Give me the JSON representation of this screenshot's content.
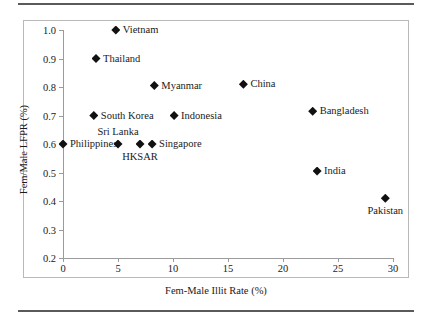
{
  "chart_data": {
    "type": "scatter",
    "title": "",
    "xlabel": "Fem-Male Illit Rate (%)",
    "ylabel": "Fem/Male LFPR (%)",
    "xlim": [
      0,
      30
    ],
    "ylim": [
      0.2,
      1.0
    ],
    "xticks": [
      "0",
      "5",
      "10",
      "15",
      "20",
      "25",
      "30"
    ],
    "xtick_values": [
      0,
      5,
      10,
      15,
      20,
      25,
      30
    ],
    "yticks": [
      "0.2",
      "0.3",
      "0.4",
      "0.5",
      "0.6",
      "0.7",
      "0.8",
      "0.9",
      "1.0"
    ],
    "ytick_values": [
      0.2,
      0.3,
      0.4,
      0.5,
      0.6,
      0.7,
      0.8,
      0.9,
      1.0
    ],
    "grid": false,
    "legend": "none",
    "marker": "diamond",
    "marker_color": "#111111",
    "points": [
      {
        "label": "Vietnam",
        "x": 4.8,
        "y": 1.0,
        "label_pos": "right"
      },
      {
        "label": "Thailand",
        "x": 3.0,
        "y": 0.9,
        "label_pos": "right"
      },
      {
        "label": "Myanmar",
        "x": 8.3,
        "y": 0.805,
        "label_pos": "right"
      },
      {
        "label": "China",
        "x": 16.4,
        "y": 0.81,
        "label_pos": "right"
      },
      {
        "label": "South Korea",
        "x": 2.8,
        "y": 0.7,
        "label_pos": "right"
      },
      {
        "label": "Indonesia",
        "x": 10.1,
        "y": 0.7,
        "label_pos": "right"
      },
      {
        "label": "Bangladesh",
        "x": 22.7,
        "y": 0.715,
        "label_pos": "right"
      },
      {
        "label": "Philippines",
        "x": 0.0,
        "y": 0.6,
        "label_pos": "right"
      },
      {
        "label": "Sri Lanka",
        "x": 5.0,
        "y": 0.6,
        "label_pos": "above"
      },
      {
        "label": "HKSAR",
        "x": 7.0,
        "y": 0.6,
        "label_pos": "below"
      },
      {
        "label": "Singapore",
        "x": 8.1,
        "y": 0.6,
        "label_pos": "right"
      },
      {
        "label": "India",
        "x": 23.1,
        "y": 0.505,
        "label_pos": "right"
      },
      {
        "label": "Pakistan",
        "x": 29.3,
        "y": 0.41,
        "label_pos": "below"
      }
    ]
  }
}
